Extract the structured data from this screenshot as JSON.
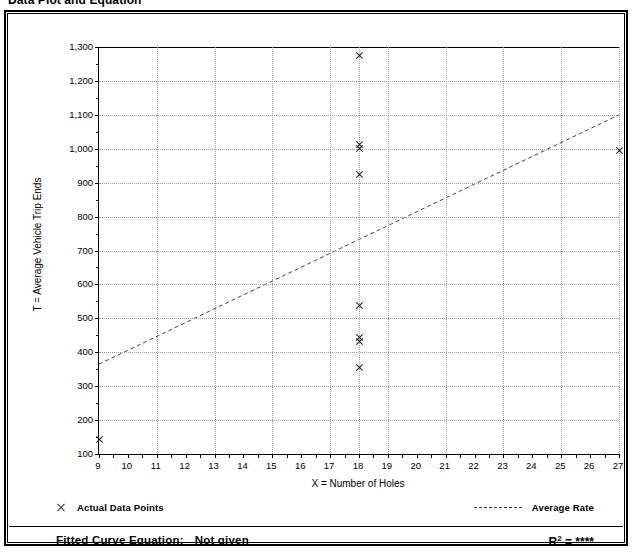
{
  "page": {
    "title": "Data Plot and Equation"
  },
  "legend": {
    "data_points_label": "Actual Data Points",
    "average_rate_label": "Average Rate",
    "marker_icon": "x-marker-icon",
    "line_icon": "dashed-line-icon"
  },
  "equation": {
    "label": "Fitted Curve Equation:",
    "value": "Not given",
    "r_squared_label": "R",
    "r_squared_exponent": "2",
    "r_squared_equals": "=",
    "r_squared_value": "****"
  },
  "chart_data": {
    "type": "scatter",
    "title": "Data Plot and Equation",
    "xlabel": "X = Number of Holes",
    "ylabel": "T = Average Vehicle Trip Ends",
    "xlim": [
      9,
      27
    ],
    "ylim": [
      100,
      1300
    ],
    "grid": true,
    "legend_position": "below-plot",
    "xticks": [
      9,
      10,
      11,
      12,
      13,
      14,
      15,
      16,
      17,
      18,
      19,
      20,
      21,
      22,
      23,
      24,
      25,
      26,
      27
    ],
    "xtick_labels": [
      "9",
      "10",
      "11",
      "12",
      "13",
      "14",
      "15",
      "16",
      "17",
      "18",
      "19",
      "20",
      "21",
      "22",
      "23",
      "24",
      "25",
      "26",
      "27"
    ],
    "yticks": [
      100,
      200,
      300,
      400,
      500,
      600,
      700,
      800,
      900,
      1000,
      1100,
      1200,
      1300
    ],
    "ytick_labels": [
      "100",
      "200",
      "300",
      "400",
      "500",
      "600",
      "700",
      "800",
      "900",
      "1,000",
      "1,100",
      "1,200",
      "1,300"
    ],
    "gridlines_x": [
      11,
      13,
      15,
      17,
      18,
      19,
      21,
      23,
      25,
      27
    ],
    "gridlines_y": [
      200,
      300,
      400,
      500,
      600,
      700,
      800,
      900,
      1000,
      1100,
      1200
    ],
    "series": [
      {
        "name": "Actual Data Points",
        "type": "scatter",
        "marker": "x",
        "points": [
          {
            "x": 9,
            "y": 143
          },
          {
            "x": 18,
            "y": 1275
          },
          {
            "x": 18,
            "y": 1012
          },
          {
            "x": 18,
            "y": 1000
          },
          {
            "x": 18,
            "y": 925
          },
          {
            "x": 18,
            "y": 538
          },
          {
            "x": 18,
            "y": 443
          },
          {
            "x": 18,
            "y": 432
          },
          {
            "x": 18,
            "y": 355
          },
          {
            "x": 27,
            "y": 995
          }
        ]
      },
      {
        "name": "Average Rate",
        "type": "line",
        "style": "dashed",
        "points": [
          {
            "x": 9,
            "y": 365
          },
          {
            "x": 27,
            "y": 1100
          }
        ]
      }
    ]
  }
}
